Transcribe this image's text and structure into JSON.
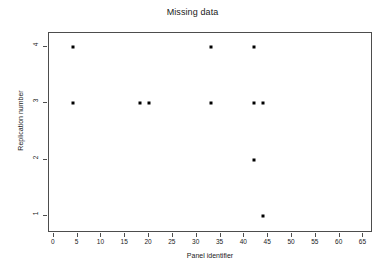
{
  "chart_data": {
    "type": "scatter",
    "title": "Missing data",
    "xlabel": "Panel identifier",
    "ylabel": "Replication number",
    "xlim": [
      -1,
      67
    ],
    "ylim": [
      0.7,
      4.25
    ],
    "grid": false,
    "legend": null,
    "xticks": [
      0,
      5,
      10,
      15,
      20,
      25,
      30,
      35,
      40,
      45,
      50,
      55,
      60,
      65
    ],
    "xtick_labels": [
      "0",
      "5",
      "10",
      "15",
      "20",
      "25",
      "30",
      "35",
      "40",
      "45",
      "50",
      "55",
      "60",
      "65"
    ],
    "yticks": [
      1,
      2,
      3,
      4
    ],
    "ytick_labels": [
      "1",
      "2",
      "3",
      "4"
    ],
    "marker": {
      "shape": "square",
      "color": "#000000",
      "size": 3
    },
    "series": [
      {
        "name": "missing",
        "points": [
          {
            "x": 4,
            "y": 4
          },
          {
            "x": 33,
            "y": 4
          },
          {
            "x": 42,
            "y": 4
          },
          {
            "x": 4,
            "y": 3
          },
          {
            "x": 18,
            "y": 3
          },
          {
            "x": 20,
            "y": 3
          },
          {
            "x": 33,
            "y": 3
          },
          {
            "x": 42,
            "y": 3
          },
          {
            "x": 44,
            "y": 3
          },
          {
            "x": 42,
            "y": 2
          },
          {
            "x": 44,
            "y": 1
          }
        ]
      }
    ],
    "x": [
      4,
      33,
      42,
      4,
      18,
      20,
      33,
      42,
      44,
      42,
      44
    ],
    "y": [
      4,
      4,
      4,
      3,
      3,
      3,
      3,
      3,
      3,
      2,
      1
    ],
    "n_points": 11,
    "colors": {
      "background": "#ffffff",
      "axis": "#4d4d4d",
      "text": "#1a1a1a",
      "marker": "#000000"
    }
  }
}
